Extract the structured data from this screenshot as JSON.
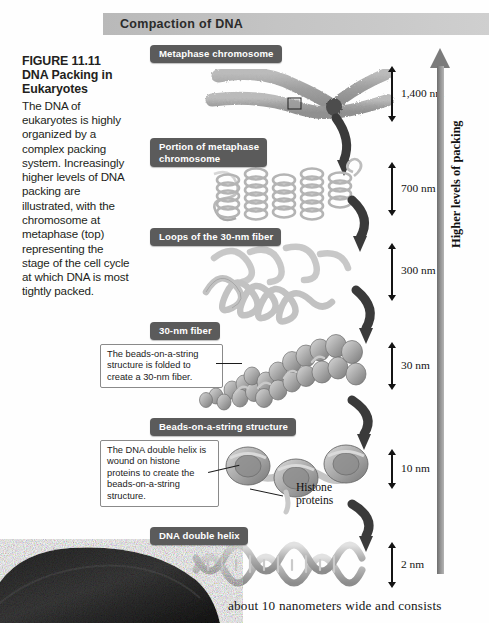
{
  "banner": {
    "title": "Compaction of DNA"
  },
  "caption": {
    "figure_number": "FIGURE 11.11",
    "figure_title": "DNA Packing in Eukaryotes",
    "body": "The DNA of eukaryotes is highly organized by a complex packing system. Increasingly higher levels of DNA packing are illustrated, with the chromosome at metaphase (top) representing the stage of the cell cycle at which DNA is most tightly packed."
  },
  "stages": [
    {
      "label": "Metaphase chromosome",
      "scale": "1,400 nm"
    },
    {
      "label": "Portion of metaphase\nchromosome",
      "scale": "700 nm"
    },
    {
      "label": "Loops of the 30-nm fiber",
      "scale": "300 nm"
    },
    {
      "label": "30-nm fiber",
      "scale": "30 nm"
    },
    {
      "label": "Beads-on-a-string structure",
      "scale": "10 nm"
    },
    {
      "label": "DNA double helix",
      "scale": "2 nm"
    }
  ],
  "callouts": [
    {
      "text": "The beads-on-a-string structure is folded to create a 30-nm fiber."
    },
    {
      "text": "The DNA double helix is wound on histone proteins to create the beads-on-a-string structure."
    }
  ],
  "annotations": {
    "histone_proteins": "Histone\nproteins",
    "packing_axis": "Higher levels of packing"
  },
  "body_text": "about 10 nanometers wide and consists",
  "colors": {
    "banner_start": "#b9b9b9",
    "banner_end": "#cfcfcf",
    "label_bg": "#5b5b5b",
    "arrow_gray": "#7b7b7b",
    "text_dark": "#231f20"
  }
}
